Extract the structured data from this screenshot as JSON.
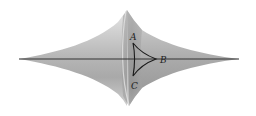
{
  "figure": {
    "labels": {
      "A": "A",
      "B": "B",
      "C": "C"
    },
    "colors": {
      "background": "#ffffff",
      "surface_light": "#d9d9d9",
      "surface_mid": "#b8b8b8",
      "surface_dark": "#8f8f8f",
      "axis": "#333333",
      "triangle": "#1a1a1a"
    }
  }
}
